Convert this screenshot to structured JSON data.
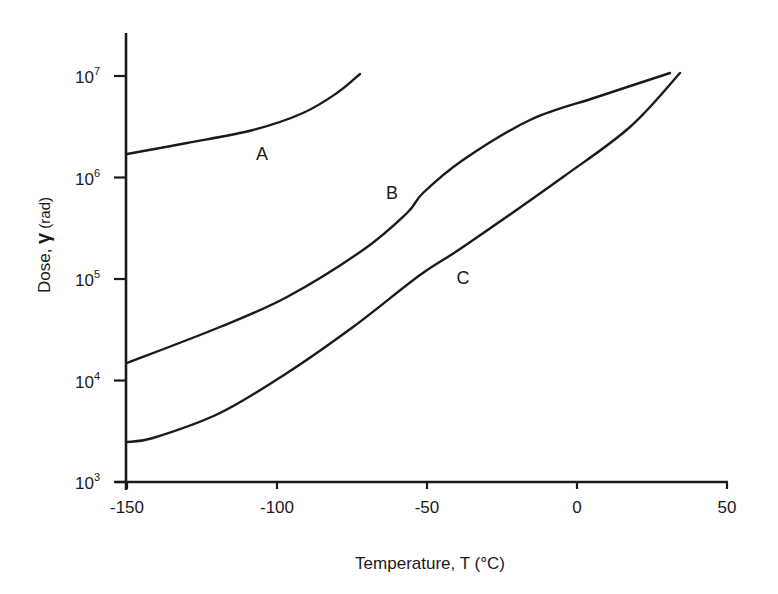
{
  "chart_data": {
    "type": "line",
    "title": "",
    "xlabel": "Temperature,  T (°C)",
    "ylabel_prefix": "Dose, ",
    "ylabel_symbol": "γ",
    "ylabel_suffix": " (rad)",
    "xlim": [
      -150,
      50
    ],
    "ylim": [
      1000,
      20000000
    ],
    "yscale": "log",
    "grid": false,
    "legend": "none (curves labeled inline)",
    "x_ticks": [
      {
        "value": -150,
        "label": "-150"
      },
      {
        "value": -100,
        "label": "-100"
      },
      {
        "value": -50,
        "label": "-50"
      },
      {
        "value": 0,
        "label": "0"
      },
      {
        "value": 50,
        "label": "50"
      }
    ],
    "y_ticks": [
      {
        "value": 1000,
        "base": "10",
        "exp": "3"
      },
      {
        "value": 10000,
        "base": "10",
        "exp": "4"
      },
      {
        "value": 100000,
        "base": "10",
        "exp": "5"
      },
      {
        "value": 1000000,
        "base": "10",
        "exp": "6"
      },
      {
        "value": 10000000,
        "base": "10",
        "exp": "7"
      }
    ],
    "series": [
      {
        "name": "A",
        "label_pos": {
          "x": -105,
          "y": 1800000
        },
        "x": [
          -150,
          -130,
          -108,
          -91,
          -80,
          -72
        ],
        "y": [
          1700000,
          2200000,
          2900000,
          4300000,
          6800000,
          10500000
        ]
      },
      {
        "name": "B",
        "label_pos": {
          "x": -62,
          "y": 650000
        },
        "x": [
          -150,
          -119,
          -97,
          -71,
          -57,
          -51,
          -38,
          -16,
          6,
          31
        ],
        "y": [
          15000,
          33000,
          65000,
          150000,
          330000,
          520000,
          1100000,
          2800000,
          4900000,
          10800000
        ]
      },
      {
        "name": "C",
        "label_pos": {
          "x": -38,
          "y": 92000
        },
        "x": [
          -150,
          -141,
          -119,
          -97,
          -75,
          -52,
          -38,
          -4,
          18,
          34
        ],
        "y": [
          2500000,
          2700,
          4800,
          12000,
          33000,
          105000,
          150000,
          740000,
          2300000,
          10800000
        ]
      }
    ]
  }
}
